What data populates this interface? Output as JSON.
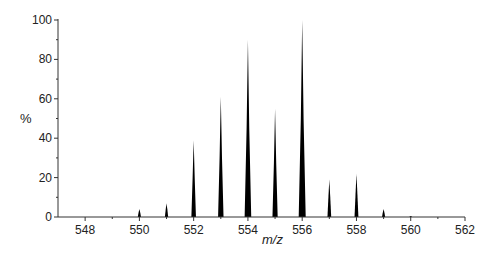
{
  "chart_data": {
    "type": "bar",
    "subtype": "mass-spectrum",
    "title": "",
    "xlabel": "m/z",
    "ylabel": "%",
    "xlim": [
      547,
      562
    ],
    "ylim": [
      0,
      100
    ],
    "xticks_major": [
      548,
      550,
      552,
      554,
      556,
      558,
      560,
      562
    ],
    "xticks_minor": [
      549,
      551,
      553,
      555,
      557,
      559,
      561
    ],
    "yticks_major": [
      0,
      20,
      40,
      60,
      80,
      100
    ],
    "yticks_minor": [
      10,
      30,
      50,
      70,
      90
    ],
    "grid": false,
    "legend": null,
    "x": [
      550,
      551,
      552,
      553,
      554,
      555,
      556,
      557,
      558,
      559,
      560
    ],
    "values": [
      4,
      7,
      39,
      61,
      90,
      55,
      100,
      19,
      22,
      4,
      0.5
    ],
    "peak_color": "#000000"
  }
}
